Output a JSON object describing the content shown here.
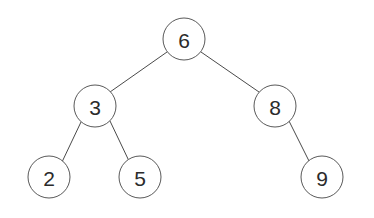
{
  "diagram": {
    "background_color": "#ffffff",
    "node_fill": "#ffffff",
    "node_stroke": "#595959",
    "edge_color": "#4a4a4a",
    "label_color": "#2b2b2b",
    "node_radius": 21,
    "nodes": [
      {
        "id": "n6",
        "label": "6",
        "cx": 184,
        "cy": 39,
        "level": 0,
        "role": "root"
      },
      {
        "id": "n3",
        "label": "3",
        "cx": 95,
        "cy": 106,
        "level": 1,
        "role": "left-child"
      },
      {
        "id": "n8",
        "label": "8",
        "cx": 275,
        "cy": 106,
        "level": 1,
        "role": "right-child"
      },
      {
        "id": "n2",
        "label": "2",
        "cx": 49,
        "cy": 177,
        "level": 2,
        "role": "leaf"
      },
      {
        "id": "n5",
        "label": "5",
        "cx": 140,
        "cy": 177,
        "level": 2,
        "role": "leaf"
      },
      {
        "id": "n9",
        "label": "9",
        "cx": 322,
        "cy": 177,
        "level": 2,
        "role": "leaf"
      }
    ],
    "edges": [
      {
        "id": "e6-3",
        "from": "6",
        "to": "3",
        "x1": 167,
        "y1": 52,
        "x2": 110,
        "y2": 92
      },
      {
        "id": "e6-8",
        "from": "6",
        "to": "8",
        "x1": 201,
        "y1": 52,
        "x2": 259,
        "y2": 92
      },
      {
        "id": "e3-2",
        "from": "3",
        "to": "2",
        "x1": 81,
        "y1": 122,
        "x2": 62,
        "y2": 162
      },
      {
        "id": "e3-5",
        "from": "3",
        "to": "5",
        "x1": 110,
        "y1": 121,
        "x2": 129,
        "y2": 161
      },
      {
        "id": "e8-9",
        "from": "8",
        "to": "9",
        "x1": 289,
        "y1": 121,
        "x2": 309,
        "y2": 161
      }
    ]
  }
}
